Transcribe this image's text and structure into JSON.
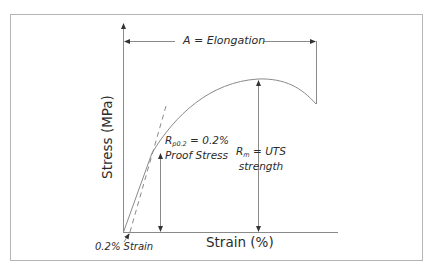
{
  "diagram": {
    "y_axis_label": "Stress (MPa)",
    "x_axis_label": "Strain (%)",
    "annotations": {
      "elongation": "A = Elongation",
      "proof_stress_symbol": "R",
      "proof_stress_subscript": "p0.2",
      "proof_stress_value": " = 0.2%",
      "proof_stress_line2": "Proof Stress",
      "uts_symbol": "R",
      "uts_subscript": "m",
      "uts_value": " = UTS",
      "uts_line2": "strength",
      "strain_offset": "0.2% Strain"
    },
    "colors": {
      "line": "#8a8a8a",
      "frame": "#b5b5b5",
      "text": "#2b2b2b"
    }
  }
}
